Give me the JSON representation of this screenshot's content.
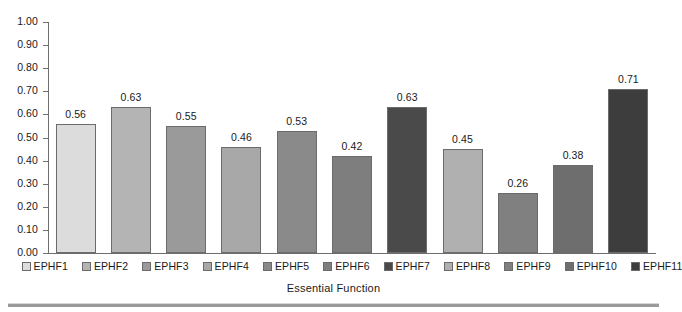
{
  "chart_data": {
    "type": "bar",
    "title": "",
    "xlabel": "Essential Function",
    "ylabel": "",
    "categories": [
      "EPHF1",
      "EPHF2",
      "EPHF3",
      "EPHF4",
      "EPHF5",
      "EPHF6",
      "EPHF7",
      "EPHF8",
      "EPHF9",
      "EPHF10",
      "EPHF11"
    ],
    "values": [
      0.56,
      0.63,
      0.55,
      0.46,
      0.53,
      0.42,
      0.63,
      0.45,
      0.26,
      0.38,
      0.71
    ],
    "value_labels": [
      "0.56",
      "0.63",
      "0.55",
      "0.46",
      "0.53",
      "0.42",
      "0.63",
      "0.45",
      "0.26",
      "0.38",
      "0.71"
    ],
    "bar_colors": [
      "#dcdcdc",
      "#b4b4b4",
      "#9a9a9a",
      "#a8a8a8",
      "#8a8a8a",
      "#7e7e7e",
      "#4a4a4a",
      "#b0b0b0",
      "#808080",
      "#6e6e6e",
      "#3d3d3d"
    ],
    "bar_border_color": "#6b6b6b",
    "ylim": [
      0.0,
      1.0
    ],
    "ytick_labels": [
      "1.00",
      "0.90",
      "0.80",
      "0.70",
      "0.60",
      "0.50",
      "0.40",
      "0.30",
      "0.20",
      "0.10",
      "0.00"
    ],
    "ytick_values": [
      1.0,
      0.9,
      0.8,
      0.7,
      0.6,
      0.5,
      0.4,
      0.3,
      0.2,
      0.1,
      0.0
    ],
    "grid": false,
    "legend_position": "bottom",
    "legend_entries": [
      "EPHF1",
      "EPHF2",
      "EPHF3",
      "EPHF4",
      "EPHF5",
      "EPHF6",
      "EPHF7",
      "EPHF8",
      "EPHF9",
      "EPHF10",
      "EPHF11"
    ],
    "axis_color": "#6e6e6e"
  }
}
